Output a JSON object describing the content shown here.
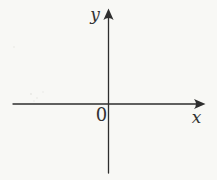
{
  "figure": {
    "background_color": "#f8f8f5",
    "axis_color": "#2e2e2e",
    "label_color": "#333333",
    "labels": {
      "y_axis": "y",
      "x_axis": "x",
      "origin": "0"
    }
  }
}
